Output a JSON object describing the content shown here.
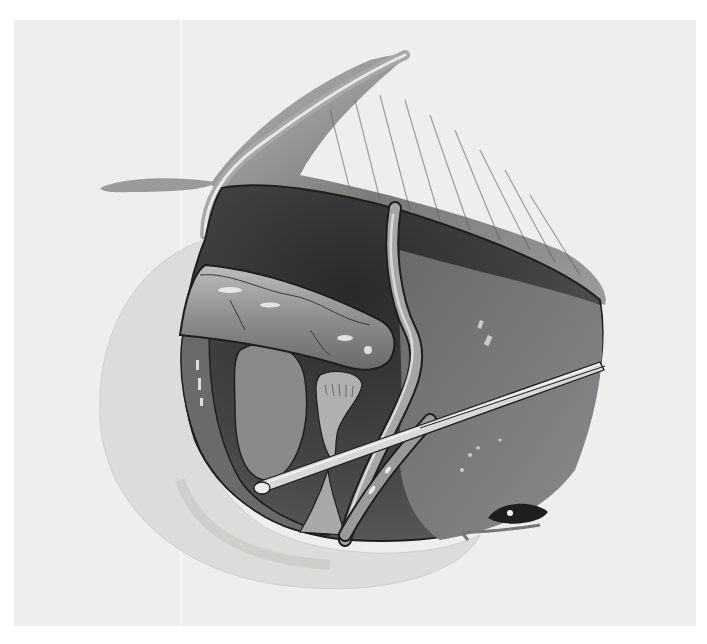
{
  "figure": {
    "type": "surgical-illustration",
    "style": "grayscale watercolor",
    "text_labels": [],
    "colors": {
      "page": "#ffffff",
      "paper": "#eeeeec",
      "cavity_dark": "#2e2e2e",
      "tissue_mid": "#6e6e6e",
      "tissue_light": "#9a9a9a",
      "drape": "#dcdcda",
      "highlight": "#f2f2f2",
      "instrument": "#d8d8d8",
      "outline": "#1e1e1e"
    },
    "elements": [
      {
        "name": "retracted-flap",
        "description": "upper skin/tissue flap folded back with striated muscle"
      },
      {
        "name": "surgical-cavity",
        "description": "dark open wound cavity"
      },
      {
        "name": "drape",
        "description": "light curved drape along left and bottom"
      },
      {
        "name": "tubular-structure",
        "description": "horizontal cylindrical structure with vessels"
      },
      {
        "name": "vessel",
        "description": "S-curved vertical vessel"
      },
      {
        "name": "instrument",
        "description": "long thin probe/rod crossing diagonally"
      },
      {
        "name": "eye",
        "description": "closed eye at lower right"
      }
    ]
  }
}
